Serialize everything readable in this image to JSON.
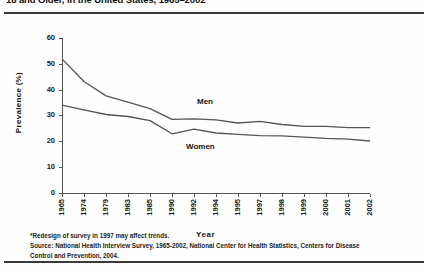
{
  "figure": {
    "title": "18 and Older, in the United States, 1965–2002",
    "men_label": "Men",
    "women_label": "Women",
    "note_redesign": "*Redesign of survey in 1997 may affect trends.",
    "note_source": "Source: National Health Interview Survey, 1965-2002, National Center for Health Statistics, Centers for Disease Control and Prevention, 2004."
  },
  "chart_data": {
    "type": "line",
    "title": "18 and Older, in the United States, 1965–2002",
    "xlabel": "Year",
    "ylabel": "Prevalence (%)",
    "ylim": [
      0,
      60
    ],
    "ytick_step": 10,
    "yticks": [
      "0",
      "10",
      "20",
      "30",
      "40",
      "50",
      "60"
    ],
    "grid": false,
    "legend": "inline-series-labels",
    "categories": [
      "1965",
      "1974",
      "1979",
      "1983",
      "1985",
      "1990",
      "1992",
      "1994",
      "1995",
      "1997",
      "1998",
      "1999",
      "2000",
      "2001",
      "2002"
    ],
    "series": [
      {
        "name": "Men",
        "color": "#555555",
        "values": [
          51.9,
          43.1,
          37.5,
          35.1,
          32.6,
          28.4,
          28.6,
          28.2,
          27.0,
          27.6,
          26.4,
          25.7,
          25.7,
          25.2,
          25.2
        ]
      },
      {
        "name": "Women",
        "color": "#555555",
        "values": [
          33.9,
          32.1,
          30.3,
          29.5,
          27.9,
          22.8,
          24.6,
          23.1,
          22.6,
          22.1,
          22.0,
          21.5,
          21.0,
          20.7,
          20.0
        ]
      }
    ]
  }
}
